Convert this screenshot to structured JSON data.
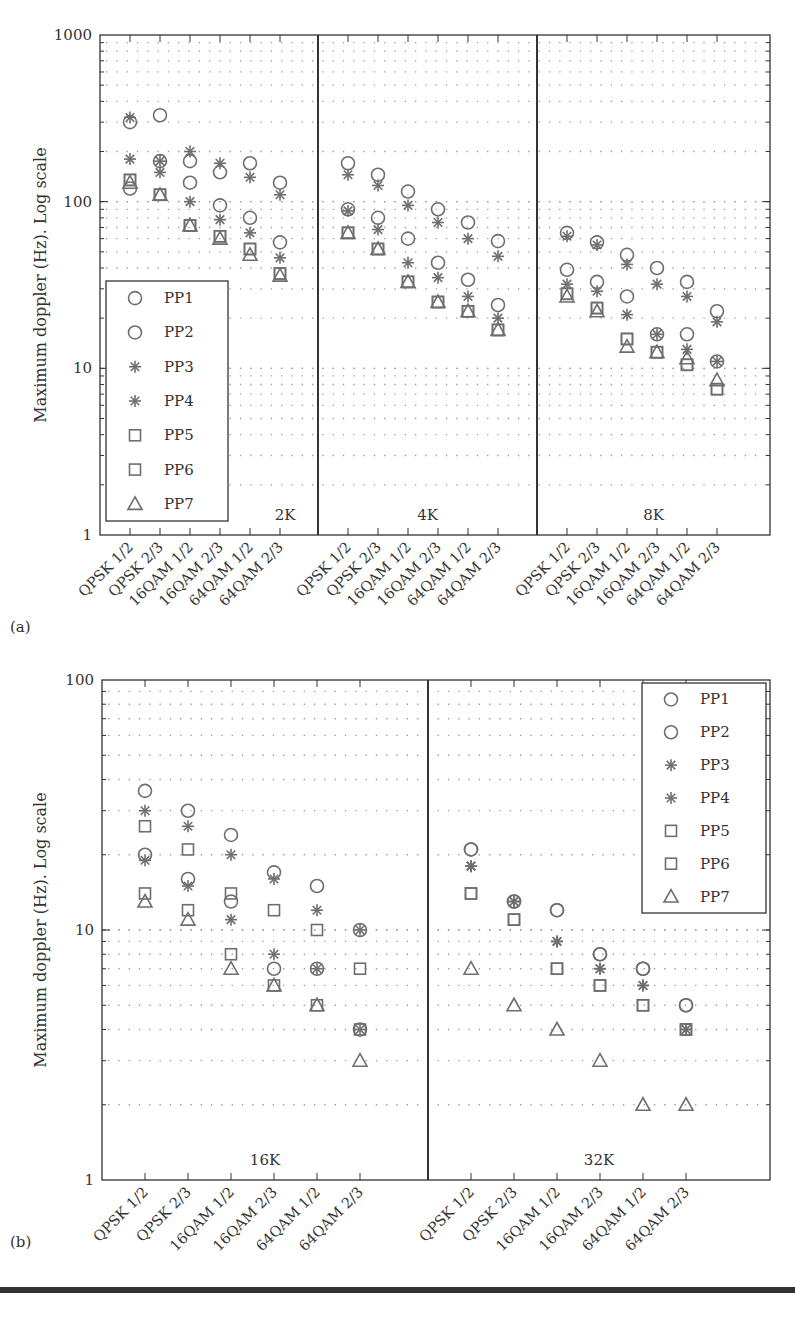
{
  "chart_data": [
    {
      "type": "scatter",
      "panel_label": "(a)",
      "ylabel": "Maximum doppler (Hz). Log scale",
      "yscale": "log",
      "ylim": [
        1,
        1000
      ],
      "yticks": [
        "1",
        "10",
        "100",
        "1000"
      ],
      "grid": "dotted",
      "legend_position": "lower-left (inside 2K group)",
      "groups": [
        "2K",
        "4K",
        "8K"
      ],
      "categories": [
        "QPSK 1/2",
        "QPSK 2/3",
        "16QAM 1/2",
        "16QAM 2/3",
        "64QAM 1/2",
        "64QAM 2/3"
      ],
      "legend": [
        {
          "name": "PP1",
          "marker": "circle"
        },
        {
          "name": "PP2",
          "marker": "circle"
        },
        {
          "name": "PP3",
          "marker": "asterisk"
        },
        {
          "name": "PP4",
          "marker": "asterisk"
        },
        {
          "name": "PP5",
          "marker": "square"
        },
        {
          "name": "PP6",
          "marker": "square"
        },
        {
          "name": "PP7",
          "marker": "triangle"
        }
      ],
      "series": {
        "2K": [
          {
            "name": "PP1",
            "values": [
              300,
              330,
              175,
              150,
              170,
              130
            ]
          },
          {
            "name": "PP2",
            "values": [
              120,
              175,
              130,
              95,
              80,
              57
            ]
          },
          {
            "name": "PP3",
            "values": [
              320,
              150,
              200,
              170,
              140,
              110
            ]
          },
          {
            "name": "PP4",
            "values": [
              180,
              175,
              100,
              78,
              65,
              46
            ]
          },
          {
            "name": "PP5",
            "values": [
              135,
              110,
              72,
              62,
              52,
              37
            ]
          },
          {
            "name": "PP6",
            "values": [
              135,
              110,
              72,
              62,
              52,
              37
            ]
          },
          {
            "name": "PP7",
            "values": [
              130,
              110,
              72,
              60,
              48,
              36
            ]
          }
        ],
        "4K": [
          {
            "name": "PP1",
            "values": [
              170,
              145,
              115,
              90,
              75,
              58
            ]
          },
          {
            "name": "PP2",
            "values": [
              90,
              80,
              60,
              43,
              34,
              24
            ]
          },
          {
            "name": "PP3",
            "values": [
              145,
              125,
              95,
              75,
              60,
              47
            ]
          },
          {
            "name": "PP4",
            "values": [
              88,
              68,
              43,
              35,
              27,
              20
            ]
          },
          {
            "name": "PP5",
            "values": [
              65,
              52,
              33,
              25,
              22,
              17
            ]
          },
          {
            "name": "PP6",
            "values": [
              65,
              52,
              33,
              25,
              22,
              17
            ]
          },
          {
            "name": "PP7",
            "values": [
              65,
              52,
              33,
              25,
              22,
              17
            ]
          }
        ],
        "8K": [
          {
            "name": "PP1",
            "values": [
              65,
              57,
              48,
              40,
              33,
              22
            ]
          },
          {
            "name": "PP2",
            "values": [
              39,
              33,
              27,
              16,
              16,
              11
            ]
          },
          {
            "name": "PP3",
            "values": [
              62,
              55,
              42,
              32,
              27,
              19
            ]
          },
          {
            "name": "PP4",
            "values": [
              32,
              29,
              21,
              16,
              13,
              11
            ]
          },
          {
            "name": "PP5",
            "values": [
              28,
              23,
              15,
              12.5,
              10.5,
              7.5
            ]
          },
          {
            "name": "PP6",
            "values": [
              28,
              23,
              15,
              12.5,
              10.5,
              7.5
            ]
          },
          {
            "name": "PP7",
            "values": [
              27,
              22,
              13.5,
              12.5,
              11.5,
              8.5
            ]
          }
        ]
      }
    },
    {
      "type": "scatter",
      "panel_label": "(b)",
      "ylabel": "Maximum doppler (Hz). Log scale",
      "yscale": "log",
      "ylim": [
        1,
        100
      ],
      "yticks": [
        "1",
        "10",
        "100"
      ],
      "grid": "dotted",
      "legend_position": "upper-right (inside 32K group)",
      "groups": [
        "16K",
        "32K"
      ],
      "categories": [
        "QPSK 1/2",
        "QPSK 2/3",
        "16QAM 1/2",
        "16QAM 2/3",
        "64QAM 1/2",
        "64QAM 2/3"
      ],
      "legend": [
        {
          "name": "PP1",
          "marker": "circle"
        },
        {
          "name": "PP2",
          "marker": "circle"
        },
        {
          "name": "PP3",
          "marker": "asterisk"
        },
        {
          "name": "PP4",
          "marker": "asterisk"
        },
        {
          "name": "PP5",
          "marker": "square"
        },
        {
          "name": "PP6",
          "marker": "square"
        },
        {
          "name": "PP7",
          "marker": "triangle"
        }
      ],
      "series": {
        "16K": [
          {
            "name": "PP1",
            "values": [
              36,
              30,
              24,
              17,
              15,
              10
            ]
          },
          {
            "name": "PP2",
            "values": [
              20,
              16,
              13,
              7,
              7,
              4
            ]
          },
          {
            "name": "PP3",
            "values": [
              30,
              26,
              20,
              16,
              12,
              10
            ]
          },
          {
            "name": "PP4",
            "values": [
              19,
              15,
              11,
              8,
              7,
              4
            ]
          },
          {
            "name": "PP5",
            "values": [
              26,
              21,
              14,
              12,
              10,
              7
            ]
          },
          {
            "name": "PP6",
            "values": [
              14,
              12,
              8,
              6,
              5,
              4
            ]
          },
          {
            "name": "PP7",
            "values": [
              13,
              11,
              7,
              6,
              5,
              3
            ]
          }
        ],
        "32K": [
          {
            "name": "PP1",
            "values": [
              21,
              13,
              12,
              8,
              7,
              5
            ]
          },
          {
            "name": "PP2",
            "values": [
              21,
              13,
              12,
              8,
              7,
              5
            ]
          },
          {
            "name": "PP3",
            "values": [
              18,
              13,
              9,
              7,
              6,
              4
            ]
          },
          {
            "name": "PP4",
            "values": [
              18,
              13,
              9,
              7,
              6,
              4
            ]
          },
          {
            "name": "PP5",
            "values": [
              14,
              11,
              7,
              6,
              5,
              4
            ]
          },
          {
            "name": "PP6",
            "values": [
              14,
              11,
              7,
              6,
              5,
              4
            ]
          },
          {
            "name": "PP7",
            "values": [
              7,
              5,
              4,
              3,
              2,
              2
            ]
          }
        ]
      }
    }
  ],
  "colors": {
    "marker": "#6e6e6e",
    "axis": "#333333",
    "grid": "#999999"
  }
}
